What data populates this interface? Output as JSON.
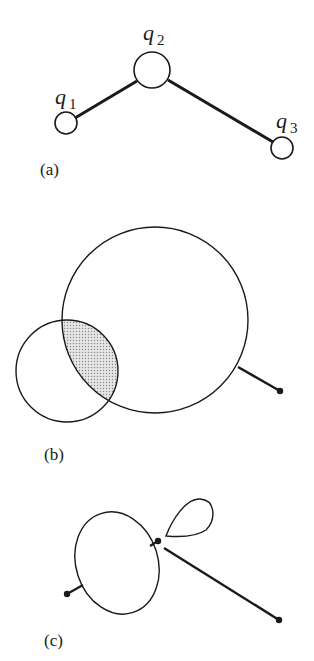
{
  "figure": {
    "panel_a": {
      "caption": "(a)",
      "nodes": [
        {
          "label": "q",
          "subscript": "1"
        },
        {
          "label": "q",
          "subscript": "2"
        },
        {
          "label": "q",
          "subscript": "3"
        }
      ]
    },
    "panel_b": {
      "caption": "(b)"
    },
    "panel_c": {
      "caption": "(c)"
    },
    "colors": {
      "stroke": "#1a1a1a",
      "shading": "#c8c8c8",
      "background": "#ffffff"
    }
  }
}
